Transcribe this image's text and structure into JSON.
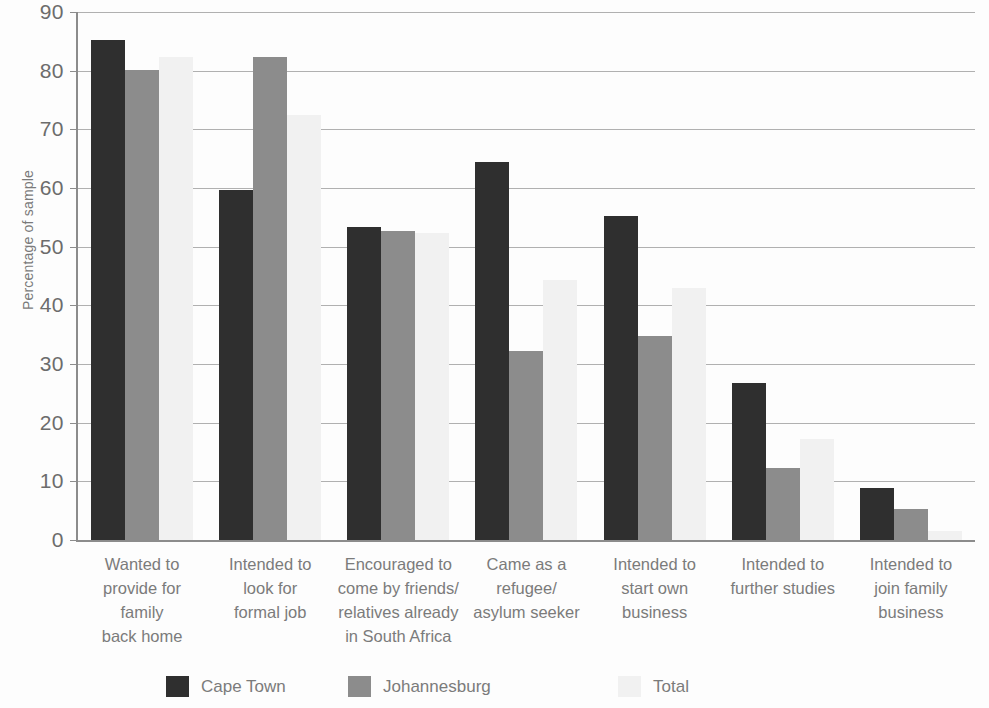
{
  "chart_data": {
    "type": "bar",
    "title": "",
    "subtitle": "",
    "xlabel": "",
    "ylabel": "Percentage of sample",
    "ylim": [
      0,
      90
    ],
    "ytick_step": 10,
    "yticks": [
      90,
      80,
      70,
      60,
      50,
      40,
      30,
      20,
      10,
      0
    ],
    "grid": true,
    "legend_position": "bottom",
    "categories": [
      "Wanted to provide for family back home",
      "Intended to look for formal job",
      "Encouraged to come by friends/ relatives already in South Africa",
      "Came as a refugee/ asylum seeker",
      "Intended to start own business",
      "Intended to further studies",
      "Intended to join family business"
    ],
    "category_lines": [
      [
        "Wanted to",
        "provide for family",
        "back home"
      ],
      [
        "Intended to",
        "look for",
        "formal job"
      ],
      [
        "Encouraged to",
        "come by friends/",
        "relatives already",
        "in South Africa"
      ],
      [
        "Came as a",
        "refugee/",
        "asylum seeker"
      ],
      [
        "Intended to",
        "start own",
        "business"
      ],
      [
        "Intended to",
        "further studies"
      ],
      [
        "Intended to",
        "join family",
        "business"
      ]
    ],
    "series": [
      {
        "name": "Cape Town",
        "color": "#2f2f2f",
        "values": [
          85.3,
          59.6,
          53.4,
          64.5,
          55.3,
          26.8,
          8.8
        ]
      },
      {
        "name": "Johannesburg",
        "color": "#8c8c8c",
        "values": [
          80.2,
          82.3,
          52.7,
          32.3,
          34.7,
          12.3,
          5.3
        ]
      },
      {
        "name": "Total",
        "color": "#f1f1f1",
        "values": [
          82.3,
          72.5,
          52.3,
          44.3,
          43.0,
          17.2,
          1.5
        ]
      }
    ]
  },
  "legend": {
    "items": [
      {
        "label": "Cape Town",
        "color": "#2f2f2f"
      },
      {
        "label": "Johannesburg",
        "color": "#8c8c8c"
      },
      {
        "label": "Total",
        "color": "#f1f1f1"
      }
    ]
  },
  "axis": {
    "y_title": "Percentage of sample"
  }
}
